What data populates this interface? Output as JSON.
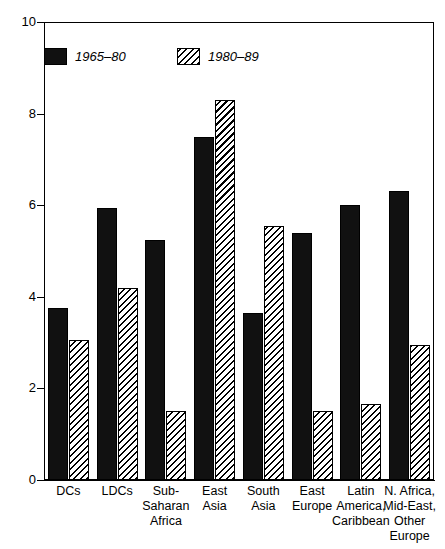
{
  "chart_data": {
    "type": "bar",
    "title": "",
    "subtitle": "",
    "xlabel": "",
    "ylabel": "",
    "ylim": [
      0,
      10
    ],
    "yticks": [
      0,
      2,
      4,
      6,
      8,
      10
    ],
    "ytick_labels": [
      "0",
      "2",
      "4",
      "6",
      "8",
      "10"
    ],
    "grid": false,
    "legend_position": "top-left",
    "categories": [
      "DCs",
      "LDCs",
      "Sub-Saharan Africa",
      "East Asia",
      "South Asia",
      "East Europe",
      "Latin America, Caribbean",
      "N. Africa, Mid-East, Other Europe"
    ],
    "category_label_lines": [
      [
        "DCs"
      ],
      [
        "LDCs"
      ],
      [
        "Sub-",
        "Saharan",
        "Africa"
      ],
      [
        "East",
        "Asia"
      ],
      [
        "South",
        "Asia"
      ],
      [
        "East",
        "Europe"
      ],
      [
        "Latin",
        "America,",
        "Caribbean"
      ],
      [
        "N. Africa,",
        "Mid-East,",
        "Other",
        "Europe"
      ]
    ],
    "series": [
      {
        "name": "1965–80",
        "fill": "solid-black",
        "color": "#111111",
        "values": [
          3.75,
          5.95,
          5.25,
          7.5,
          3.65,
          5.4,
          6.0,
          6.3
        ]
      },
      {
        "name": "1980–89",
        "fill": "diagonal-hatch",
        "color": "#ffffff",
        "values": [
          3.05,
          4.2,
          1.5,
          8.3,
          5.55,
          1.5,
          1.65,
          2.95
        ]
      }
    ]
  },
  "legend": {
    "items": [
      {
        "label": "1965–80",
        "style": "solid"
      },
      {
        "label": "1980–89",
        "style": "hatch"
      }
    ]
  },
  "colors": {
    "axis": "#000000",
    "series_one": "#111111",
    "series_two_fill": "#ffffff",
    "series_two_hatch": "#000000",
    "background": "#ffffff"
  }
}
